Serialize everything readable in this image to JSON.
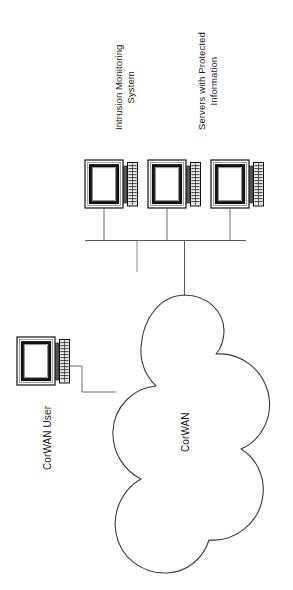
{
  "diagram": {
    "orientation": "rotated-90",
    "stroke_color": "#1a1a1a",
    "background_color": "#ffffff"
  },
  "labels": {
    "intrusion_monitoring": {
      "line1": "Intrusion Monitoring",
      "line2": "System"
    },
    "servers_protected": {
      "line1": "Servers with Protected",
      "line2": "Information"
    },
    "corwan_user": "CorWAN User",
    "cloud": "CorWAN"
  },
  "nodes": [
    {
      "id": "intrusion-monitoring-system",
      "type": "computer",
      "label_ref": "intrusion_monitoring"
    },
    {
      "id": "protected-server-1",
      "type": "computer",
      "label_ref": "servers_protected"
    },
    {
      "id": "protected-server-2",
      "type": "computer",
      "label_ref": "servers_protected"
    },
    {
      "id": "corwan-user",
      "type": "computer",
      "label_ref": "corwan_user"
    },
    {
      "id": "corwan-cloud",
      "type": "cloud",
      "label_ref": "cloud"
    }
  ],
  "icons": {
    "computer": "computer-icon",
    "monitor": "monitor-icon",
    "keyboard": "keyboard-icon",
    "cloud": "cloud-icon"
  },
  "connections": [
    {
      "from": "intrusion-monitoring-system",
      "to": "network-bus"
    },
    {
      "from": "protected-server-1",
      "to": "network-bus"
    },
    {
      "from": "protected-server-2",
      "to": "network-bus"
    },
    {
      "from": "network-bus",
      "to": "corwan-cloud"
    },
    {
      "from": "corwan-user",
      "to": "corwan-cloud"
    }
  ]
}
